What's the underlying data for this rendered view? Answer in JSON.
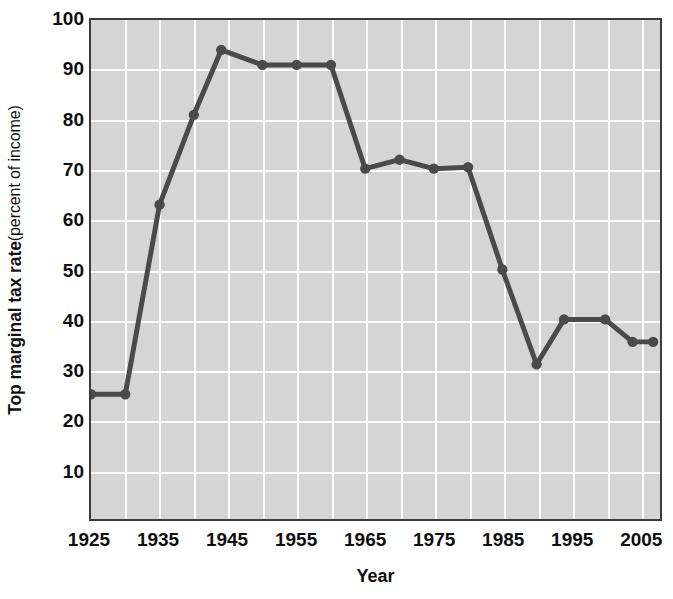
{
  "chart_data": {
    "type": "line",
    "title": "",
    "xlabel": "Year",
    "ylabel_bold": "Top marginal tax rate",
    "ylabel_light": " (percent of income)",
    "xlim": [
      1925,
      2008
    ],
    "ylim": [
      0,
      100
    ],
    "grid": true,
    "legend": "none",
    "x_tick_labels": [
      "1925",
      "1935",
      "1945",
      "1955",
      "1965",
      "1975",
      "1985",
      "1995",
      "2005"
    ],
    "x_tick_values": [
      1925,
      1935,
      1945,
      1955,
      1965,
      1975,
      1985,
      1995,
      2005
    ],
    "y_tick_labels": [
      "100",
      "90",
      "80",
      "70",
      "60",
      "50",
      "40",
      "30",
      "20",
      "10"
    ],
    "y_tick_values": [
      100,
      90,
      80,
      70,
      60,
      50,
      40,
      30,
      20,
      10
    ],
    "x_gridline_values": [
      1930,
      1935,
      1940,
      1945,
      1950,
      1955,
      1960,
      1965,
      1970,
      1975,
      1980,
      1985,
      1990,
      1995,
      2000,
      2005
    ],
    "y_gridline_values": [
      10,
      20,
      30,
      40,
      50,
      60,
      70,
      80,
      90
    ],
    "series": [
      {
        "name": "Top marginal tax rate",
        "x": [
          1925,
          1930,
          1935,
          1940,
          1944,
          1950,
          1955,
          1960,
          1965,
          1970,
          1975,
          1980,
          1985,
          1990,
          1994,
          2000,
          2004,
          2007
        ],
        "values": [
          25,
          25,
          63,
          81,
          94,
          91,
          91,
          91,
          70.2,
          72,
          70.2,
          70.5,
          50,
          31,
          40,
          40,
          35.5,
          35.5
        ],
        "color": "#4a4a4a",
        "marker": "circle"
      }
    ],
    "colors": {
      "plot_background": "#d5d5d5",
      "gridline": "#fdfdfd",
      "frame": "#3c3c3c",
      "line": "#4a4a4a",
      "text": "#0d0d0d",
      "page_background": "#ffffff"
    }
  }
}
